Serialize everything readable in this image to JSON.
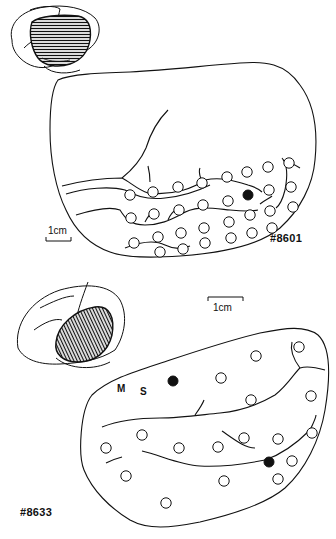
{
  "figure_top": {
    "case_id": "#8601",
    "scale_label": "1cm",
    "electrodes_open": [
      [
        130,
        195
      ],
      [
        153,
        192
      ],
      [
        178,
        187
      ],
      [
        202,
        183
      ],
      [
        227,
        177
      ],
      [
        247,
        172
      ],
      [
        268,
        167
      ],
      [
        289,
        163
      ],
      [
        269,
        190
      ],
      [
        291,
        187
      ],
      [
        131,
        218
      ],
      [
        154,
        214
      ],
      [
        179,
        210
      ],
      [
        203,
        205
      ],
      [
        228,
        201
      ],
      [
        250,
        215
      ],
      [
        270,
        211
      ],
      [
        293,
        207
      ],
      [
        134,
        243
      ],
      [
        158,
        237
      ],
      [
        181,
        233
      ],
      [
        204,
        228
      ],
      [
        229,
        222
      ],
      [
        252,
        233
      ],
      [
        272,
        228
      ],
      [
        160,
        252
      ],
      [
        183,
        249
      ],
      [
        205,
        243
      ],
      [
        231,
        238
      ]
    ],
    "electrodes_filled": [
      [
        248,
        195
      ]
    ]
  },
  "figure_bottom": {
    "case_id": "#8633",
    "scale_label": "1cm",
    "label_m": "M",
    "label_s": "S",
    "electrodes_open": [
      [
        299,
        347
      ],
      [
        256,
        356
      ],
      [
        221,
        378
      ],
      [
        251,
        400
      ],
      [
        311,
        396
      ],
      [
        142,
        435
      ],
      [
        106,
        448
      ],
      [
        179,
        448
      ],
      [
        218,
        447
      ],
      [
        244,
        438
      ],
      [
        278,
        439
      ],
      [
        312,
        433
      ],
      [
        292,
        461
      ],
      [
        126,
        476
      ],
      [
        224,
        481
      ],
      [
        278,
        479
      ],
      [
        166,
        503
      ]
    ],
    "electrodes_filled": [
      [
        173,
        381
      ],
      [
        269,
        462
      ]
    ]
  },
  "colors": {
    "ink": "#111111",
    "background": "#ffffff"
  }
}
